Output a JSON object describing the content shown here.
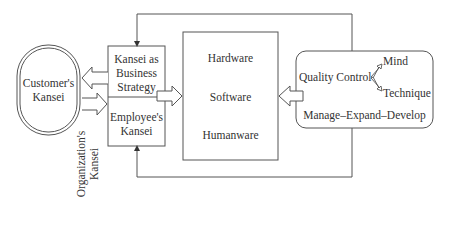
{
  "diagram": {
    "customer": {
      "label_line1": "Customer's",
      "label_line2": "Kansei"
    },
    "organization": {
      "label_line1": "Organization's",
      "label_line2": "Kansei",
      "top_box": {
        "line1": "Kansei as",
        "line2": "Business",
        "line3": "Strategy"
      },
      "bottom_box": {
        "line1": "Employee's",
        "line2": "Kansei"
      }
    },
    "resources": {
      "items": [
        "Hardware",
        "Software",
        "Humanware"
      ]
    },
    "quality": {
      "title": "Quality Control",
      "branch_top": "Mind",
      "branch_bottom": "Technique",
      "cycle": "Manage–Expand–Develop"
    }
  },
  "colors": {
    "stroke": "#555555",
    "background": "#ffffff",
    "text": "#333333"
  }
}
